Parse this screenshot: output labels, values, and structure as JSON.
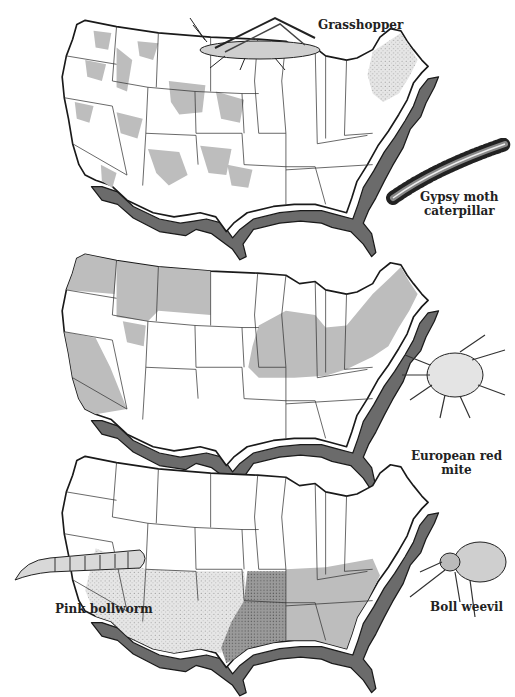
{
  "figure": {
    "maps": [
      {
        "id": "map-1",
        "pests": [
          "Grasshopper",
          "Gypsy moth caterpillar"
        ],
        "range_styles": {
          "Grasshopper": "gray patches (western/plains)",
          "Gypsy moth caterpillar": "stippled (northeast)"
        }
      },
      {
        "id": "map-2",
        "pests": [
          "European red mite"
        ],
        "range_styles": {
          "European red mite": "gray (Pacific NW, California, Idaho, Montana, Midwest, Northeast)"
        }
      },
      {
        "id": "map-3",
        "pests": [
          "Pink bollworm",
          "Boll weevil"
        ],
        "range_styles": {
          "Pink bollworm": "light stipple (southwest)",
          "Boll weevil": "gray (southeast) / dark stipple (Texas-Oklahoma)"
        }
      }
    ]
  },
  "labels": {
    "grasshopper": "Grasshopper",
    "gypsy_moth_line1": "Gypsy moth",
    "gypsy_moth_line2": "caterpillar",
    "european_red_mite": "European red mite",
    "pink_bollworm": "Pink bollworm",
    "boll_weevil": "Boll weevil"
  },
  "colors": {
    "shade": "#bdbdbd",
    "shadow": "#6b6b6b",
    "outline": "#1a1a1a"
  }
}
